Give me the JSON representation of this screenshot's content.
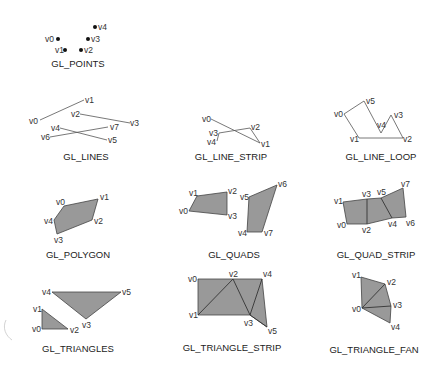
{
  "diagrams": {
    "points": {
      "title": "GL_POINTS",
      "vertices": [
        {
          "name": "v0",
          "x": 58,
          "y": 39
        },
        {
          "name": "v1",
          "x": 65,
          "y": 50
        },
        {
          "name": "v2",
          "x": 81,
          "y": 50
        },
        {
          "name": "v3",
          "x": 88,
          "y": 39
        },
        {
          "name": "v4",
          "x": 95,
          "y": 27
        }
      ]
    },
    "lines": {
      "title": "GL_LINES",
      "vertices": [
        {
          "name": "v0",
          "x": 40,
          "y": 120
        },
        {
          "name": "v1",
          "x": 84,
          "y": 100
        },
        {
          "name": "v2",
          "x": 80,
          "y": 114
        },
        {
          "name": "v3",
          "x": 130,
          "y": 123
        },
        {
          "name": "v4",
          "x": 60,
          "y": 128
        },
        {
          "name": "v5",
          "x": 107,
          "y": 140
        },
        {
          "name": "v6",
          "x": 50,
          "y": 137
        },
        {
          "name": "v7",
          "x": 108,
          "y": 127
        }
      ]
    },
    "line_strip": {
      "title": "GL_LINE_STRIP",
      "vertices": [
        {
          "name": "v0",
          "x": 211,
          "y": 119
        },
        {
          "name": "v1",
          "x": 260,
          "y": 143
        },
        {
          "name": "v2",
          "x": 250,
          "y": 128
        },
        {
          "name": "v3",
          "x": 219,
          "y": 133
        },
        {
          "name": "v4",
          "x": 217,
          "y": 141
        }
      ]
    },
    "line_loop": {
      "title": "GL_LINE_LOOP",
      "vertices": [
        {
          "name": "v0",
          "x": 344,
          "y": 114
        },
        {
          "name": "v1",
          "x": 359,
          "y": 138
        },
        {
          "name": "v2",
          "x": 403,
          "y": 138
        },
        {
          "name": "v3",
          "x": 391,
          "y": 115
        },
        {
          "name": "v4",
          "x": 381,
          "y": 133
        },
        {
          "name": "v5",
          "x": 364,
          "y": 101
        }
      ]
    },
    "polygon": {
      "title": "GL_POLYGON",
      "vertices": [
        {
          "name": "v0",
          "x": 64,
          "y": 206
        },
        {
          "name": "v1",
          "x": 98,
          "y": 199
        },
        {
          "name": "v2",
          "x": 92,
          "y": 220
        },
        {
          "name": "v3",
          "x": 57,
          "y": 234
        },
        {
          "name": "v4",
          "x": 54,
          "y": 220
        }
      ]
    },
    "quads": {
      "title": "GL_QUADS",
      "vertices": [
        {
          "name": "v0",
          "x": 189,
          "y": 211
        },
        {
          "name": "v1",
          "x": 197,
          "y": 196
        },
        {
          "name": "v2",
          "x": 227,
          "y": 192
        },
        {
          "name": "v3",
          "x": 227,
          "y": 215
        },
        {
          "name": "v4",
          "x": 247,
          "y": 232
        },
        {
          "name": "v5",
          "x": 249,
          "y": 197
        },
        {
          "name": "v6",
          "x": 277,
          "y": 185
        },
        {
          "name": "v7",
          "x": 262,
          "y": 232
        }
      ]
    },
    "quad_strip": {
      "title": "GL_QUAD_STRIP",
      "vertices": [
        {
          "name": "v0",
          "x": 347,
          "y": 224
        },
        {
          "name": "v1",
          "x": 343,
          "y": 202
        },
        {
          "name": "v2",
          "x": 367,
          "y": 224
        },
        {
          "name": "v3",
          "x": 367,
          "y": 199
        },
        {
          "name": "v4",
          "x": 392,
          "y": 218
        },
        {
          "name": "v5",
          "x": 381,
          "y": 198
        },
        {
          "name": "v6",
          "x": 406,
          "y": 217
        },
        {
          "name": "v7",
          "x": 403,
          "y": 188
        }
      ]
    },
    "triangles": {
      "title": "GL_TRIANGLES",
      "vertices": [
        {
          "name": "v0",
          "x": 42,
          "y": 329
        },
        {
          "name": "v1",
          "x": 42,
          "y": 309
        },
        {
          "name": "v2",
          "x": 68,
          "y": 329
        },
        {
          "name": "v3",
          "x": 86,
          "y": 319
        },
        {
          "name": "v4",
          "x": 52,
          "y": 292
        },
        {
          "name": "v5",
          "x": 121,
          "y": 292
        }
      ]
    },
    "triangle_strip": {
      "title": "GL_TRIANGLE_STRIP",
      "vertices": [
        {
          "name": "v0",
          "x": 198,
          "y": 279
        },
        {
          "name": "v1",
          "x": 198,
          "y": 315
        },
        {
          "name": "v2",
          "x": 233,
          "y": 279
        },
        {
          "name": "v3",
          "x": 250,
          "y": 315
        },
        {
          "name": "v4",
          "x": 262,
          "y": 279
        },
        {
          "name": "v5",
          "x": 267,
          "y": 327
        }
      ]
    },
    "triangle_fan": {
      "title": "GL_TRIANGLE_FAN",
      "vertices": [
        {
          "name": "v0",
          "x": 362,
          "y": 308
        },
        {
          "name": "v1",
          "x": 361,
          "y": 277
        },
        {
          "name": "v2",
          "x": 385,
          "y": 284
        },
        {
          "name": "v3",
          "x": 391,
          "y": 306
        },
        {
          "name": "v4",
          "x": 390,
          "y": 323
        }
      ]
    }
  },
  "colors": {
    "fill": "#999999",
    "stroke": "#444444",
    "text": "#333333"
  }
}
